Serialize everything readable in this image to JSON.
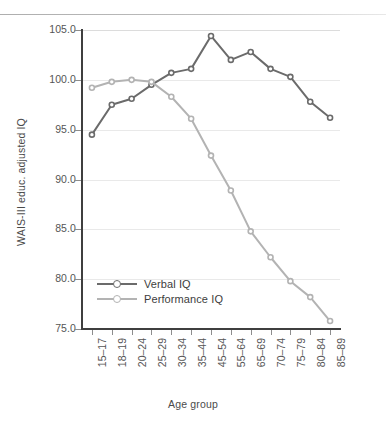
{
  "chart_data": {
    "type": "line",
    "title": "",
    "xlabel": "Age group",
    "ylabel": "WAIS-III educ. adjusted IQ",
    "categories": [
      "15–17",
      "18–19",
      "20–24",
      "25–29",
      "30–34",
      "35–44",
      "45–54",
      "55–64",
      "65–69",
      "70–74",
      "75–79",
      "80–84",
      "85–89"
    ],
    "ylim": [
      75.0,
      105.0
    ],
    "yticks": [
      "75.0",
      "80.0",
      "85.0",
      "90.0",
      "95.0",
      "100.0",
      "105.0"
    ],
    "ytick_values": [
      75.0,
      80.0,
      85.0,
      90.0,
      95.0,
      100.0,
      105.0
    ],
    "grid": "horizontal",
    "legend_position": "inside-lower-left",
    "series": [
      {
        "name": "Verbal IQ",
        "color": "#6b6b6b",
        "values": [
          94.5,
          97.5,
          98.1,
          99.5,
          100.7,
          101.1,
          104.4,
          102.0,
          102.8,
          101.1,
          100.3,
          97.8,
          96.2
        ]
      },
      {
        "name": "Performance IQ",
        "color": "#b3b3b3",
        "values": [
          99.2,
          99.8,
          100.0,
          99.8,
          98.3,
          96.1,
          92.4,
          88.9,
          84.8,
          82.2,
          79.8,
          78.2,
          75.8
        ]
      }
    ]
  },
  "legend": {
    "items": [
      {
        "label": "Verbal IQ",
        "color": "#6b6b6b"
      },
      {
        "label": "Performance IQ",
        "color": "#b3b3b3"
      }
    ]
  },
  "axes": {
    "y_title": "WAIS-III educ. adjusted IQ",
    "x_title": "Age group"
  }
}
